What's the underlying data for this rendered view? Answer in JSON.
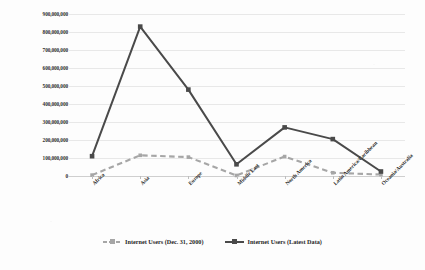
{
  "chart_data": {
    "type": "line",
    "title": "",
    "subtitle": "",
    "xlabel": "",
    "ylabel": "",
    "grid": true,
    "legend_position": "bottom",
    "ylim": [
      0,
      900000000
    ],
    "ytick_labels": [
      "900,000,000",
      "800,000,000",
      "700,000,000",
      "600,000,000",
      "500,000,000",
      "400,000,000",
      "300,000,000",
      "200,000,000",
      "100,000,000",
      "0"
    ],
    "ytick_values": [
      900000000,
      800000000,
      700000000,
      600000000,
      500000000,
      400000000,
      300000000,
      200000000,
      100000000,
      0
    ],
    "categories": [
      "Africa",
      "Asia",
      "Europe",
      "Middle East",
      "North America",
      "Latin America/Caribbean",
      "Oceania/Australia"
    ],
    "series": [
      {
        "name": "Internet Users (Dec. 31, 2000)",
        "color": "#a6a6a6",
        "style": "dashed",
        "marker": "square",
        "values": [
          5000000,
          115000000,
          105000000,
          3000000,
          108000000,
          18000000,
          8000000
        ]
      },
      {
        "name": "Internet Users (Latest Data)",
        "color": "#4a4a4a",
        "style": "solid",
        "marker": "square",
        "values": [
          110000000,
          830000000,
          480000000,
          65000000,
          270000000,
          205000000,
          25000000
        ]
      }
    ]
  },
  "legend": {
    "items": [
      {
        "label": "Internet Users (Dec. 31, 2000)"
      },
      {
        "label": "Internet Users (Latest Data)"
      }
    ]
  }
}
